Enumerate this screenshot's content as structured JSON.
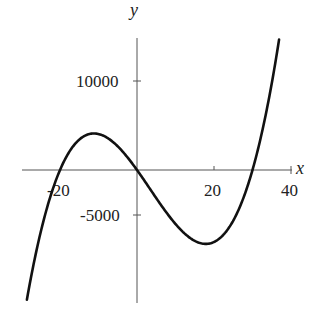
{
  "chart_data": {
    "type": "line",
    "title": "",
    "xlabel": "x",
    "ylabel": "y",
    "xlim": [
      -30,
      40
    ],
    "ylim": [
      -15000,
      15000
    ],
    "x_ticks": [
      -20,
      20,
      40
    ],
    "x_tick_labels": [
      "-20",
      "20",
      "40"
    ],
    "y_ticks": [
      10000,
      -5000
    ],
    "y_tick_labels": [
      "10000",
      "-5000"
    ],
    "grid": false,
    "legend": null,
    "function": "y = x^3 - 10x^2 - 600x",
    "series": [
      {
        "name": "curve",
        "x": [
          -28.5,
          -25,
          -20,
          -15,
          -12,
          -10,
          -5,
          0,
          5,
          10,
          15,
          18,
          20,
          25,
          30,
          35,
          37
        ],
        "y": [
          -14600,
          -7500,
          0,
          3375,
          4030,
          4000,
          2625,
          0,
          -2875,
          -5000,
          -5625,
          -8200,
          -8000,
          -6875,
          0,
          10500,
          15000
        ]
      }
    ],
    "annotations": {
      "roots": [
        -20,
        0,
        30
      ],
      "local_max": {
        "x": -12,
        "y": 4000
      },
      "local_min": {
        "x": 18,
        "y": -8200
      }
    }
  },
  "labels": {
    "x_axis": "x",
    "y_axis": "y",
    "tick_x_neg20": "-20",
    "tick_x_20": "20",
    "tick_x_40": "40",
    "tick_y_10000": "10000",
    "tick_y_neg5000": "-5000"
  },
  "colors": {
    "curve": "#111111",
    "axes": "#555555"
  }
}
